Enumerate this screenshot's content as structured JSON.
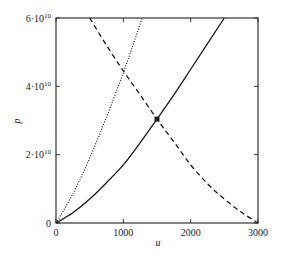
{
  "chart_data": {
    "type": "line",
    "title": "",
    "xlabel": "u",
    "ylabel": "p",
    "xlim": [
      0,
      3000
    ],
    "ylim": [
      0,
      60000000000
    ],
    "grid": false,
    "legend": null,
    "x_ticks": [
      0,
      1000,
      2000,
      3000
    ],
    "x_tick_labels": [
      "0",
      "1000",
      "2000",
      "3000"
    ],
    "y_ticks": [
      0,
      20000000000,
      40000000000,
      60000000000
    ],
    "y_tick_labels": [
      {
        "base": "0",
        "exp": ""
      },
      {
        "base": "2·10",
        "exp": "10"
      },
      {
        "base": "4·10",
        "exp": "10"
      },
      {
        "base": "6·10",
        "exp": "10"
      }
    ],
    "series": [
      {
        "name": "solid",
        "style": "solid",
        "x": [
          0,
          250,
          500,
          750,
          1000,
          1250,
          1500,
          1750,
          2000,
          2250,
          2500
        ],
        "y": [
          0,
          3000000000,
          7000000000,
          11800000000,
          17000000000,
          23500000000,
          30400000000,
          37500000000,
          45000000000,
          52500000000,
          60000000000
        ]
      },
      {
        "name": "dotted",
        "style": "dotted",
        "x": [
          0,
          250,
          500,
          750,
          1000,
          1150,
          1280
        ],
        "y": [
          0,
          8500000000,
          19000000000,
          31000000000,
          44000000000,
          52500000000,
          60000000000
        ]
      },
      {
        "name": "dashed",
        "style": "dashed",
        "x": [
          500,
          750,
          1000,
          1250,
          1500,
          1750,
          2000,
          2250,
          2500,
          2750,
          3000
        ],
        "y": [
          60000000000,
          52000000000,
          44500000000,
          37500000000,
          30400000000,
          23800000000,
          17000000000,
          11500000000,
          7000000000,
          3200000000,
          0
        ]
      }
    ],
    "annotations": [
      {
        "type": "marker",
        "shape": "square",
        "x": 1500,
        "y": 30400000000,
        "label": ""
      }
    ]
  },
  "colors": {
    "line": "#1a1a1a",
    "axis": "#333333",
    "background": "#ffffff"
  }
}
